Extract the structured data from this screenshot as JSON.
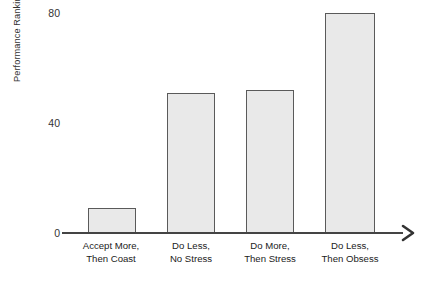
{
  "chart_data": {
    "type": "bar",
    "title": "",
    "subtitle": "",
    "xlabel": "",
    "ylabel": "Performance Ranking (Percentile)",
    "categories": [
      "Accept More, Then Coast",
      "Do Less, No Stress",
      "Do More, Then Stress",
      "Do Less, Then Obsess"
    ],
    "category_lines": [
      [
        "Accept More,",
        "Then Coast"
      ],
      [
        "Do Less,",
        "No Stress"
      ],
      [
        "Do More,",
        "Then Stress"
      ],
      [
        "Do Less,",
        "Then Obsess"
      ]
    ],
    "values": [
      9,
      51,
      52,
      80
    ],
    "ylim": [
      0,
      86
    ],
    "yticks": [
      0,
      40,
      80
    ],
    "ytick_labels": [
      "0",
      "40",
      "80"
    ],
    "grid": false,
    "legend": null,
    "legend_position": "none",
    "annotations": [],
    "style": {
      "bar_fill": "#e9e9e9",
      "bar_border": "#5a5a5a",
      "axis_color": "#444444",
      "text_color": "#333333",
      "background": "#ffffff",
      "x_axis_arrow": true,
      "y_axis_spine": false
    }
  },
  "axis": {
    "arrow_icon": "arrow-right-icon"
  }
}
